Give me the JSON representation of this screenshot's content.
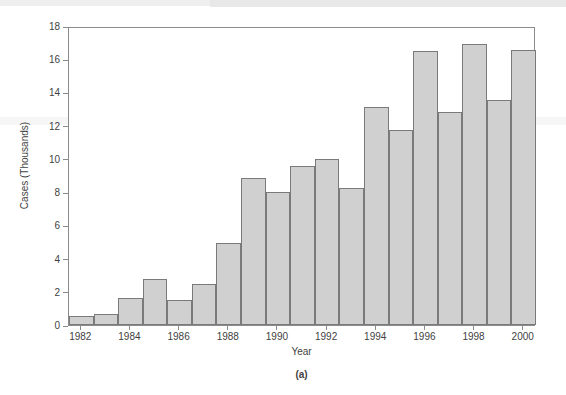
{
  "figure": {
    "caption": "(a)"
  },
  "chart_data": {
    "type": "bar",
    "title": "",
    "xlabel": "Year",
    "ylabel": "Cases (Thousands)",
    "categories": [
      "1982",
      "1983",
      "1984",
      "1985",
      "1986",
      "1987",
      "1988",
      "1989",
      "1990",
      "1991",
      "1992",
      "1993",
      "1994",
      "1995",
      "1996",
      "1997",
      "1998",
      "1999",
      "2000"
    ],
    "values": [
      0.55,
      0.68,
      1.6,
      2.8,
      1.48,
      2.45,
      4.95,
      8.85,
      8.0,
      9.55,
      10.0,
      8.25,
      13.1,
      11.75,
      16.5,
      12.85,
      16.9,
      13.55,
      16.55
    ],
    "xtick_labels": [
      "1982",
      "1984",
      "1986",
      "1988",
      "1990",
      "1992",
      "1994",
      "1996",
      "1998",
      "2000"
    ],
    "ytick_labels": [
      "0",
      "2",
      "4",
      "6",
      "8",
      "10",
      "12",
      "14",
      "16",
      "18"
    ],
    "ytick_values": [
      0,
      2,
      4,
      6,
      8,
      10,
      12,
      14,
      16,
      18
    ],
    "ylim": [
      0,
      18
    ],
    "grid": false,
    "legend": null,
    "bar_fill_color": "#d0d0d0",
    "bar_edge_color": "#7a7a7a",
    "axis_color": "#8b8b8b"
  }
}
